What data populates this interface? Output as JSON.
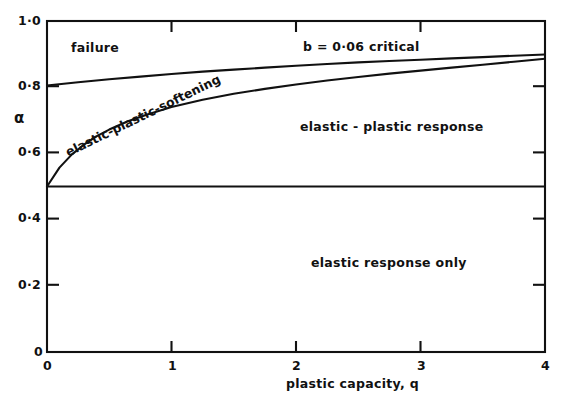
{
  "chart_data": {
    "type": "line",
    "title": "",
    "xlabel": "plastic capacity, q",
    "ylabel": "α",
    "xlim": [
      0,
      4
    ],
    "ylim": [
      0,
      1.0
    ],
    "grid": false,
    "legend": "inline-annotations",
    "xticks": [
      0,
      1,
      2,
      3,
      4
    ],
    "xticklabels": [
      "0",
      "1",
      "2",
      "3",
      "4"
    ],
    "yticks": [
      0,
      0.2,
      0.4,
      0.6,
      0.8,
      1.0
    ],
    "yticklabels": [
      "0",
      "0·2",
      "0·4",
      "0·6",
      "0·8",
      "1·0"
    ],
    "series": [
      {
        "name": "b = 0·06 critical",
        "comment": "upper boundary separating failure from elastic-plastic-softening",
        "x": [
          0,
          0.25,
          0.5,
          0.75,
          1.0,
          1.25,
          1.5,
          1.75,
          2.0,
          2.25,
          2.5,
          2.75,
          3.0,
          3.25,
          3.5,
          3.75,
          4.0
        ],
        "y": [
          0.805,
          0.815,
          0.824,
          0.832,
          0.84,
          0.847,
          0.853,
          0.859,
          0.865,
          0.87,
          0.875,
          0.879,
          0.883,
          0.887,
          0.891,
          0.895,
          0.899
        ]
      },
      {
        "name": "elastic-plastic-softening boundary",
        "comment": "lower boundary separating elastic-plastic-softening from elastic-plastic response",
        "x": [
          0,
          0.1,
          0.2,
          0.3,
          0.4,
          0.5,
          0.65,
          0.8,
          1.0,
          1.25,
          1.5,
          1.75,
          2.0,
          2.25,
          2.5,
          2.75,
          3.0,
          3.25,
          3.5,
          3.75,
          4.0
        ],
        "y": [
          0.5,
          0.557,
          0.597,
          0.627,
          0.652,
          0.672,
          0.697,
          0.717,
          0.74,
          0.762,
          0.78,
          0.795,
          0.808,
          0.82,
          0.831,
          0.841,
          0.85,
          0.859,
          0.868,
          0.877,
          0.886
        ]
      },
      {
        "name": "elastic limit",
        "comment": "horizontal line at alpha = 0.5 separating elastic response only",
        "x": [
          0,
          4
        ],
        "y": [
          0.5,
          0.5
        ]
      }
    ],
    "annotations": [
      {
        "text": "failure",
        "x": 0.55,
        "y": 0.928,
        "rotation": 0
      },
      {
        "text": "b = 0·06 critical",
        "x": 2.05,
        "y": 0.93,
        "rotation": 0
      },
      {
        "text": "elastic-plastic-softening",
        "x": 0.58,
        "y": 0.71,
        "rotation": -26
      },
      {
        "text": "elastic-plastic response",
        "x": 2.45,
        "y": 0.655,
        "rotation": 0
      },
      {
        "text": "elastic response only",
        "x": 2.45,
        "y": 0.275,
        "rotation": 0
      }
    ],
    "colors": {
      "background": "#ffffff",
      "axis": "#111111",
      "curve": "#111111",
      "text": "#111111"
    }
  },
  "axes": {
    "y_label": "α",
    "x_title": "plastic capacity, q",
    "y_tick_labels": [
      "1·0",
      "0·8",
      "0·6",
      "0·4",
      "0·2",
      "0"
    ],
    "x_tick_labels": [
      "0",
      "1",
      "2",
      "3",
      "4"
    ]
  },
  "annotations": {
    "failure": "failure",
    "b_critical": "b = 0·06 critical",
    "softening": "elastic-plastic-softening",
    "elastic_plastic": "elastic - plastic response",
    "elastic_only": "elastic response only"
  }
}
